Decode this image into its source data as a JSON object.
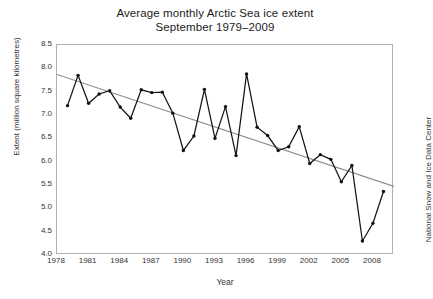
{
  "chart_data": {
    "type": "line",
    "title": "Average monthly Arctic Sea ice extent",
    "subtitle": "September 1979–2009",
    "xlabel": "Year",
    "ylabel": "Extent (million square kilometres)",
    "credit": "National Snow and Ice Data Center",
    "xlim": [
      1978,
      2010
    ],
    "ylim": [
      4.0,
      8.5
    ],
    "grid": false,
    "legend": "none",
    "xticks": [
      1978,
      1981,
      1984,
      1987,
      1990,
      1993,
      1996,
      1999,
      2002,
      2005,
      2008
    ],
    "yticks": [
      "8.5",
      "8.0",
      "7.5",
      "7.0",
      "6.5",
      "6.0",
      "5.5",
      "5.0",
      "4.5",
      "4.0"
    ],
    "x": [
      1979,
      1980,
      1981,
      1982,
      1983,
      1984,
      1985,
      1986,
      1987,
      1988,
      1989,
      1990,
      1991,
      1992,
      1993,
      1994,
      1995,
      1996,
      1997,
      1998,
      1999,
      2000,
      2001,
      2002,
      2003,
      2004,
      2005,
      2006,
      2007,
      2008,
      2009
    ],
    "series": [
      {
        "name": "September sea ice extent",
        "color": "#151515",
        "marker": "circle",
        "values": [
          7.2,
          7.85,
          7.25,
          7.45,
          7.52,
          7.17,
          6.93,
          7.54,
          7.48,
          7.49,
          7.04,
          6.24,
          6.55,
          7.55,
          6.5,
          7.18,
          6.13,
          7.88,
          6.74,
          6.56,
          6.24,
          6.32,
          6.75,
          5.96,
          6.15,
          6.05,
          5.57,
          5.92,
          4.3,
          4.68,
          5.36
        ]
      }
    ],
    "trendline": {
      "name": "linear trend",
      "color": "#8c8c8c",
      "start": {
        "x": 1978.0,
        "y": 7.87
      },
      "end": {
        "x": 2010.0,
        "y": 5.47
      }
    }
  }
}
